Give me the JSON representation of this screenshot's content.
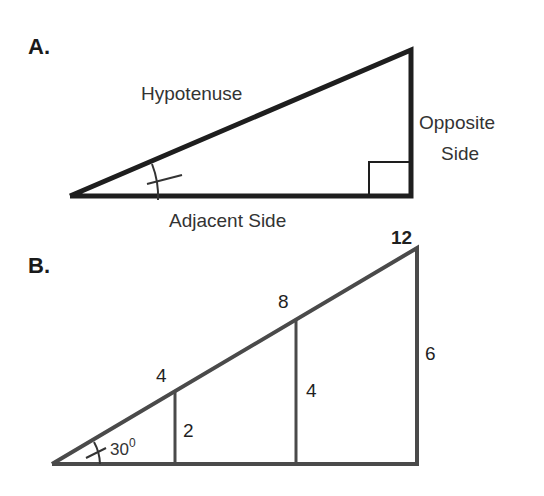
{
  "diagram": {
    "panel_a": {
      "label": "A.",
      "hypotenuse_label": "Hypotenuse",
      "opposite_label_line1": "Opposite",
      "opposite_label_line2": "Side",
      "adjacent_label": "Adjacent Side"
    },
    "panel_b": {
      "label": "B.",
      "angle_label": "30",
      "angle_degree": "0",
      "hypotenuse_marks": [
        "4",
        "8",
        "12"
      ],
      "vertical_sides": [
        "2",
        "4",
        "6"
      ]
    },
    "colors": {
      "panel_a_stroke": "#1e1e1e",
      "panel_b_stroke": "#4a4a4a",
      "background": "#ffffff"
    }
  }
}
